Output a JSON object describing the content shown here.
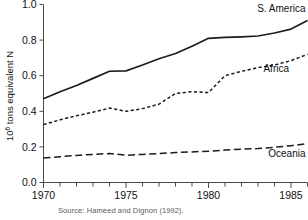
{
  "chart_data": {
    "type": "line",
    "title": "",
    "subtitle": "",
    "xlabel": "",
    "ylabel": "10⁶ tons equivalent N",
    "ylabel_base": "10",
    "ylabel_exponent": "6",
    "ylabel_rest": " tons equivalent N",
    "xlim": [
      1970,
      1986
    ],
    "ylim": [
      0.0,
      1.0
    ],
    "grid": false,
    "legend_position": "inline-right-end-of-line",
    "x_major_ticks": [
      1970,
      1975,
      1980,
      1985
    ],
    "x_major_tick_labels": [
      "1970",
      "1975",
      "1980",
      "1985"
    ],
    "x_minor_ticks": [
      1971,
      1972,
      1973,
      1974,
      1976,
      1977,
      1978,
      1979,
      1981,
      1982,
      1983,
      1984,
      1986
    ],
    "y_ticks": [
      0.0,
      0.2,
      0.4,
      0.6,
      0.8,
      1.0
    ],
    "y_tick_labels": [
      "0.0",
      "0.2",
      "0.4",
      "0.6",
      "0.8",
      "1.0"
    ],
    "x": [
      1970,
      1971,
      1972,
      1973,
      1974,
      1975,
      1976,
      1977,
      1978,
      1979,
      1980,
      1981,
      1982,
      1983,
      1984,
      1985,
      1986
    ],
    "series": [
      {
        "name": "S. America",
        "label": "S. America",
        "linestyle": "solid",
        "color": "#1c1c1c",
        "values": [
          0.47,
          0.51,
          0.545,
          0.585,
          0.625,
          0.627,
          0.66,
          0.695,
          0.725,
          0.765,
          0.81,
          0.815,
          0.818,
          0.823,
          0.84,
          0.862,
          0.91
        ]
      },
      {
        "name": "Africa",
        "label": "Africa",
        "linestyle": "dotted-short-dash",
        "color": "#1c1c1c",
        "values": [
          0.325,
          0.352,
          0.375,
          0.395,
          0.418,
          0.4,
          0.415,
          0.44,
          0.5,
          0.51,
          0.505,
          0.6,
          0.625,
          0.645,
          0.66,
          0.685,
          0.72
        ]
      },
      {
        "name": "Oceania",
        "label": "Oceania",
        "linestyle": "long-dash",
        "color": "#1c1c1c",
        "values": [
          0.137,
          0.145,
          0.152,
          0.158,
          0.163,
          0.153,
          0.158,
          0.163,
          0.168,
          0.172,
          0.176,
          0.182,
          0.187,
          0.191,
          0.198,
          0.207,
          0.218
        ]
      }
    ]
  },
  "caption": {
    "source_text": "Source: Hameed and Dignon (1992)."
  }
}
